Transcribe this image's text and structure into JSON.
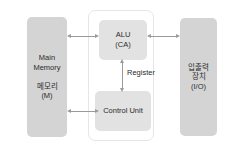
{
  "diagram": {
    "colors": {
      "outer_block": "#d4d4d4",
      "inner_block": "#e2e2e2",
      "cpu_border": "#e6e6e6",
      "arrow": "#9a9a9a",
      "text": "#2b2b2b",
      "background": "#ffffff"
    },
    "blocks": {
      "main_memory": {
        "line1": "Main",
        "line2": "Memory",
        "line3": "메모리",
        "line4": "(M)"
      },
      "io_device": {
        "line1": "입출력",
        "line2": "장치",
        "line3": "(I/O)"
      },
      "alu": {
        "line1": "ALU",
        "line2": "(CA)"
      },
      "control_unit": {
        "line1": "Control Unit"
      }
    },
    "connectors": {
      "register_label": "Register",
      "memory_to_alu": "bidirectional",
      "memory_to_control_unit": "bidirectional",
      "alu_to_io": "bidirectional",
      "alu_to_control_unit": "bidirectional"
    }
  }
}
